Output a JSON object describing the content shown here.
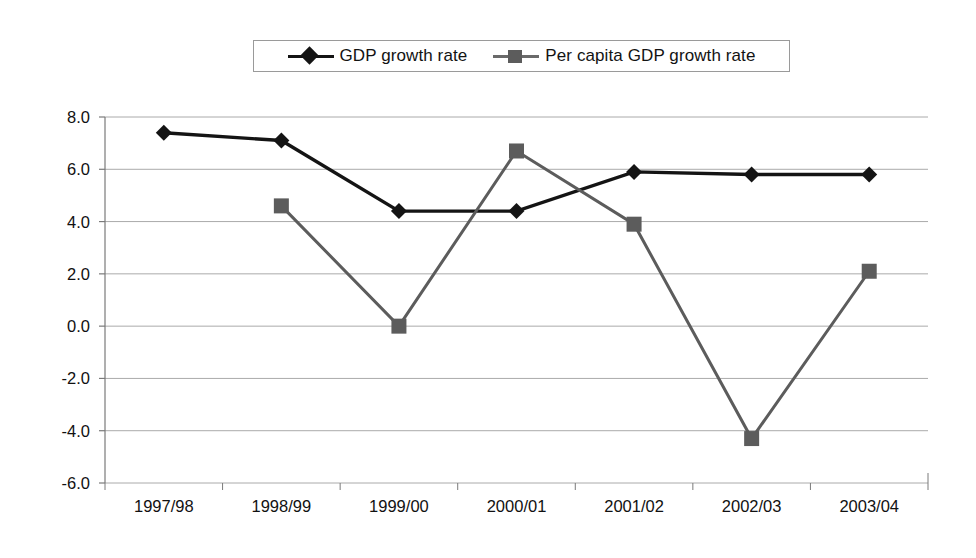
{
  "chart_data": {
    "type": "line",
    "title": "",
    "subtitle": "",
    "xlabel": "",
    "ylabel": "",
    "categories": [
      "1997/98",
      "1998/99",
      "1999/00",
      "2000/01",
      "2001/02",
      "2002/03",
      "2003/04"
    ],
    "series": [
      {
        "name": "GDP growth rate",
        "marker": "diamond",
        "color": "#141414",
        "values": [
          7.4,
          7.1,
          4.4,
          4.4,
          5.9,
          5.8,
          5.8
        ]
      },
      {
        "name": "Per capita GDP growth rate",
        "marker": "square",
        "color": "#5c5c5c",
        "values": [
          null,
          4.6,
          0.0,
          6.7,
          3.9,
          -4.3,
          2.1
        ]
      }
    ],
    "ylim": [
      -6.0,
      8.0
    ],
    "ytick_step": 2.0,
    "ytick_labels": [
      "8.0",
      "6.0",
      "4.0",
      "2.0",
      "0.0",
      "-2.0",
      "-4.0",
      "-6.0"
    ],
    "ytick_values": [
      8.0,
      6.0,
      4.0,
      2.0,
      0.0,
      -2.0,
      -4.0,
      -6.0
    ],
    "grid": true,
    "grid_axis": "y",
    "legend_position": "top",
    "legend_entries": [
      "GDP growth rate",
      "Per capita GDP growth rate"
    ],
    "background": "#ffffff",
    "gridline_color": "#aaaaaa",
    "axis_color": "#7a7a7a"
  },
  "legend": {
    "items": [
      {
        "label": "GDP growth rate",
        "marker": "diamond-marker",
        "color": "#141414"
      },
      {
        "label": "Per capita GDP growth rate",
        "marker": "square-marker",
        "color": "#5c5c5c"
      }
    ]
  }
}
